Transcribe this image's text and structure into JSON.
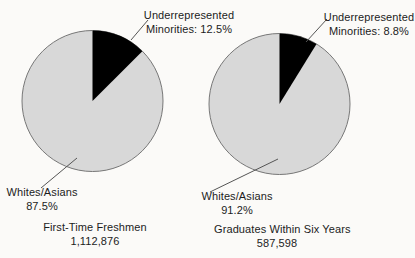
{
  "colors": {
    "majority_slice": "#d8d8d8",
    "minority_slice": "#000000",
    "pie_outline": "#777777",
    "leader_line": "#555555",
    "text": "#1c1c1c",
    "background": "#fbfaf8"
  },
  "chart_data": [
    {
      "type": "pie",
      "title": "First-Time Freshmen",
      "total_label": "1,112,876",
      "start_angle_deg": -90,
      "direction": "clockwise",
      "slices": [
        {
          "label": "Whites/Asians",
          "value": 87.5,
          "color": "#d8d8d8"
        },
        {
          "label": "Underrepresented Minorities",
          "value": 12.5,
          "color": "#000000"
        }
      ],
      "labels": {
        "minority_line1": "Underrepresented",
        "minority_line2": "Minorities: 12.5%",
        "majority_line1": "Whites/Asians",
        "majority_line2": "87.5%"
      }
    },
    {
      "type": "pie",
      "title": "Graduates Within Six Years",
      "total_label": "587,598",
      "start_angle_deg": -90,
      "direction": "clockwise",
      "slices": [
        {
          "label": "Whites/Asians",
          "value": 91.2,
          "color": "#d8d8d8"
        },
        {
          "label": "Underrepresented Minorities",
          "value": 8.8,
          "color": "#000000"
        }
      ],
      "labels": {
        "minority_line1": "Underrepresented",
        "minority_line2": "Minorities: 8.8%",
        "majority_line1": "Whites/Asians",
        "majority_line2": "91.2%"
      }
    }
  ]
}
